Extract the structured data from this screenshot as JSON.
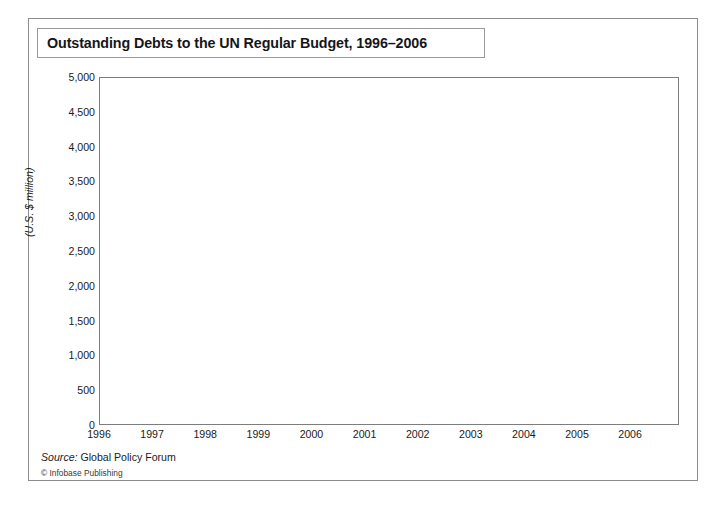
{
  "figure": {
    "title": "Outstanding Debts to the UN Regular Budget, 1996–2006",
    "source_label": "Source:",
    "source_name": " Global Policy Forum",
    "credit": "© Infobase Publishing"
  },
  "colors": {
    "area_fill": "#bdbdbd",
    "area_edge": "#9e9e9e",
    "gridline": "#6f6f6f",
    "frame": "#7d7d7d",
    "text": "#1b1b1b",
    "page_background": "#ffffff"
  },
  "chart_data": {
    "type": "area",
    "title": "Outstanding Debts to the UN Regular Budget, 1996–2006",
    "xlabel": "",
    "ylabel": "(U.S. $ million)",
    "ylim": [
      0,
      5000
    ],
    "xlim": [
      1996.0,
      2006.92
    ],
    "ytick_labels": [
      "0",
      "500",
      "1,000",
      "1,500",
      "2,000",
      "2,500",
      "3,000",
      "3,500",
      "4,000",
      "4,500",
      "5,000"
    ],
    "ytick_values": [
      0,
      500,
      1000,
      1500,
      2000,
      2500,
      3000,
      3500,
      4000,
      4500,
      5000
    ],
    "xtick_labels": [
      "1996",
      "1997",
      "1998",
      "1999",
      "2000",
      "2001",
      "2002",
      "2003",
      "2004",
      "2005",
      "2006"
    ],
    "xtick_values": [
      1996,
      1997,
      1998,
      1999,
      2000,
      2001,
      2002,
      2003,
      2004,
      2005,
      2006
    ],
    "grid": "horizontal",
    "legend": "none",
    "series_name": "Outstanding debts to the UN Regular Budget",
    "units": "U.S. $ million",
    "frequency": "monthly",
    "x": [
      1996.0,
      1996.08,
      1996.17,
      1996.25,
      1996.33,
      1996.42,
      1996.5,
      1996.58,
      1996.67,
      1996.75,
      1996.83,
      1996.92,
      1997.0,
      1997.08,
      1997.17,
      1997.25,
      1997.33,
      1997.42,
      1997.5,
      1997.58,
      1997.67,
      1997.75,
      1997.83,
      1997.92,
      1998.0,
      1998.08,
      1998.17,
      1998.25,
      1998.33,
      1998.42,
      1998.5,
      1998.58,
      1998.67,
      1998.75,
      1998.83,
      1998.92,
      1999.0,
      1999.08,
      1999.17,
      1999.25,
      1999.33,
      1999.42,
      1999.5,
      1999.58,
      1999.67,
      1999.75,
      1999.83,
      1999.92,
      2000.0,
      2000.08,
      2000.17,
      2000.25,
      2000.33,
      2000.42,
      2000.5,
      2000.58,
      2000.67,
      2000.75,
      2000.83,
      2000.92,
      2001.0,
      2001.08,
      2001.17,
      2001.25,
      2001.33,
      2001.42,
      2001.5,
      2001.58,
      2001.67,
      2001.75,
      2001.83,
      2001.92,
      2002.0,
      2002.08,
      2002.17,
      2002.25,
      2002.33,
      2002.42,
      2002.5,
      2002.58,
      2002.67,
      2002.75,
      2002.83,
      2002.92,
      2003.0,
      2003.08,
      2003.17,
      2003.25,
      2003.33,
      2003.42,
      2003.5,
      2003.58,
      2003.67,
      2003.75,
      2003.83,
      2003.92,
      2004.0,
      2004.08,
      2004.17,
      2004.25,
      2004.33,
      2004.42,
      2004.5,
      2004.58,
      2004.67,
      2004.75,
      2004.83,
      2004.92,
      2005.0,
      2005.08,
      2005.17,
      2005.25,
      2005.33,
      2005.42,
      2005.5,
      2005.58,
      2005.67,
      2005.75,
      2005.83,
      2005.92,
      2006.0,
      2006.08,
      2006.17,
      2006.25,
      2006.33,
      2006.42,
      2006.5,
      2006.58,
      2006.67,
      2006.75,
      2006.83
    ],
    "values": [
      3230,
      3120,
      2960,
      2800,
      2660,
      2560,
      2640,
      2750,
      2620,
      2540,
      2480,
      2450,
      2480,
      2980,
      3080,
      2840,
      2700,
      2620,
      2500,
      2430,
      2420,
      2560,
      2670,
      2630,
      2520,
      2440,
      2420,
      2700,
      2770,
      2720,
      2640,
      2560,
      2490,
      2430,
      2560,
      2650,
      2600,
      2520,
      2450,
      2420,
      2450,
      2780,
      2820,
      2780,
      2720,
      2650,
      2590,
      2700,
      2780,
      2740,
      3400,
      3250,
      3050,
      3060,
      3020,
      3140,
      3180,
      3060,
      2960,
      2880,
      2840,
      3800,
      4040,
      3700,
      3560,
      3470,
      3440,
      4000,
      4300,
      4060,
      3880,
      3700,
      3520,
      3420,
      3160,
      2700,
      2640,
      2600,
      3440,
      3260,
      3080,
      2900,
      2780,
      2680,
      2580,
      2480,
      2360,
      2280,
      2440,
      2560,
      2480,
      3800,
      3540,
      3240,
      2920,
      2600,
      2440,
      2380,
      2300,
      2260,
      1720,
      1840,
      4080,
      4140,
      3800,
      3520,
      3320,
      3160,
      3420,
      3460,
      3300,
      3240,
      3750,
      4380,
      3980,
      3720,
      3560,
      3500,
      3700,
      3550,
      3440,
      3660,
      4200,
      4400,
      4150,
      3880,
      3600,
      3380,
      3280,
      3160,
      3080
    ],
    "notes": {
      "peak_value": 4400,
      "peak_period": "2006",
      "min_value": 1720,
      "min_period": "2004",
      "start_value": 3230,
      "end_value": 3080
    }
  }
}
